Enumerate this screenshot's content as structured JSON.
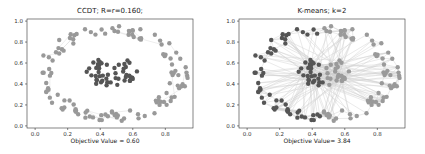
{
  "chart_data": [
    {
      "type": "scatter",
      "title": "CCDT; R=r=0.160;",
      "xlabel": "Objective Value = 0.60",
      "ylabel": "",
      "xlim": [
        -0.05,
        0.97
      ],
      "ylim": [
        -0.02,
        1.02
      ],
      "xticks": [
        "0.0",
        "0.2",
        "0.4",
        "0.6",
        "0.8"
      ],
      "yticks": [
        "0.0",
        "0.2",
        "0.4",
        "0.6",
        "0.8",
        "1.0"
      ],
      "grid": false,
      "legend": null,
      "description": "Two concentric clusters: outer ring (light gray) and inner blob (dark gray) with sparse faint edges",
      "series": [
        {
          "name": "inner cluster",
          "color": "#555555",
          "center": [
            0.46,
            0.52
          ],
          "radius": 0.14
        },
        {
          "name": "outer ring",
          "color": "#999999",
          "center": [
            0.47,
            0.52
          ],
          "radius_x": 0.45,
          "radius_y": 0.45
        }
      ]
    },
    {
      "type": "scatter",
      "title": "K-means; k=2",
      "xlabel": "Objective Value= 3.84",
      "ylabel": "",
      "xlim": [
        -0.05,
        0.97
      ],
      "ylim": [
        -0.02,
        1.02
      ],
      "xticks": [
        "0.0",
        "0.2",
        "0.4",
        "0.6",
        "0.8"
      ],
      "yticks": [
        "0.0",
        "0.2",
        "0.4",
        "0.6",
        "0.8",
        "1.0"
      ],
      "grid": false,
      "legend": null,
      "description": "Same ring + blob data split by k-means into left (dark) and right (light) halves, dense connecting edges",
      "series": [
        {
          "name": "cluster 1 (left)",
          "color": "#555555"
        },
        {
          "name": "cluster 2 (right)",
          "color": "#999999"
        }
      ]
    }
  ]
}
